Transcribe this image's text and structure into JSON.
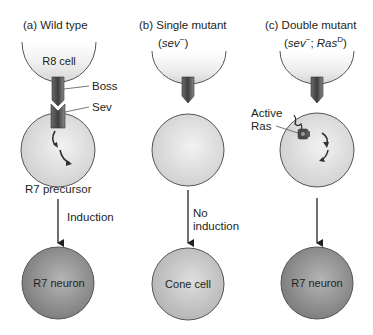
{
  "panels": [
    {
      "title": "(a)  Wild type",
      "top_cell": "R8 cell",
      "ligand_label": "Boss",
      "receptor_label": "Sev",
      "precursor_label": "R7 precursor",
      "arrow_label": "Induction",
      "result": "R7 neuron"
    },
    {
      "title": "(b)  Single mutant",
      "genotype_open": "(",
      "genotype_italic": "sev",
      "genotype_sup": "−",
      "genotype_close": ")",
      "arrow_label_line1": "No",
      "arrow_label_line2": "induction",
      "result": "Cone cell"
    },
    {
      "title": "(c)  Double mutant",
      "genotype_open": "(",
      "genotype_italic": "sev",
      "genotype_sup": "−",
      "genotype_sep": "; ",
      "genotype_italic2": "Ras",
      "genotype_sup2": "D",
      "genotype_close": ")",
      "active_label_line1": "Active",
      "active_label_line2": "Ras",
      "result": "R7 neuron"
    }
  ],
  "colors": {
    "cell_light": "#dcdcdc",
    "cell_dark": "#8a8a8a",
    "protein": "#4a4a4a",
    "text": "#231f20"
  }
}
